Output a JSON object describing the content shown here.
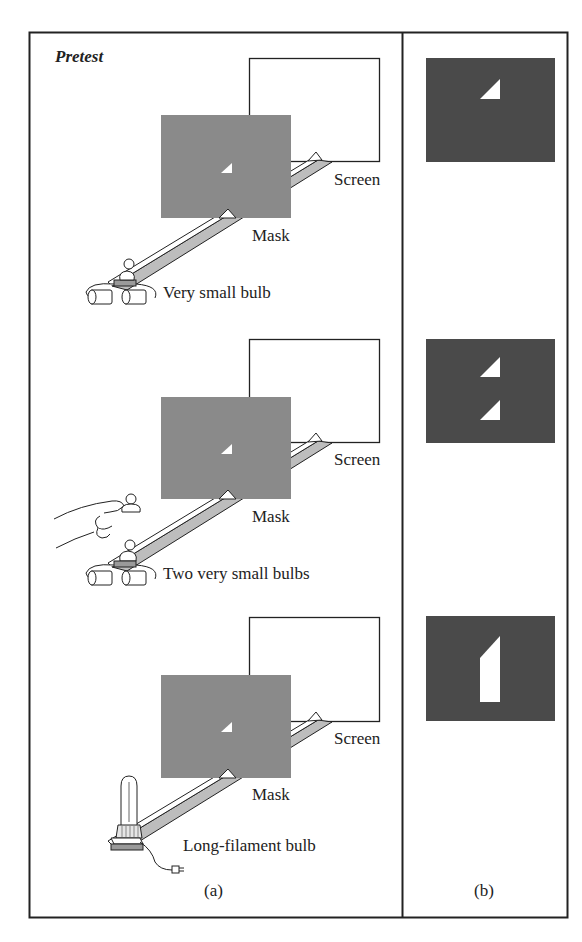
{
  "figure": {
    "title": "Pretest",
    "colors": {
      "mask_gray": "#8a8a8a",
      "screen_dark": "#4a4a4a",
      "aperture_white": "#ffffff",
      "line": "#222222",
      "rail_fill": "#bdbdbd"
    },
    "column_a": {
      "caption": "(a)",
      "panels": [
        {
          "screen_label": "Screen",
          "mask_label": "Mask",
          "source_label": "Very small bulb",
          "source_type": "battery-bulb-icon"
        },
        {
          "screen_label": "Screen",
          "mask_label": "Mask",
          "source_label": "Two very small bulbs",
          "source_type": "hand-held-bulb-icon"
        },
        {
          "screen_label": "Screen",
          "mask_label": "Mask",
          "source_label": "Long-filament bulb",
          "source_type": "long-filament-bulb-icon"
        }
      ]
    },
    "column_b": {
      "caption": "(b)",
      "panels": [
        {
          "image_description": "single small triangle of light"
        },
        {
          "image_description": "two small triangles of light, stacked"
        },
        {
          "image_description": "elongated light shape with slanted top"
        }
      ]
    }
  }
}
